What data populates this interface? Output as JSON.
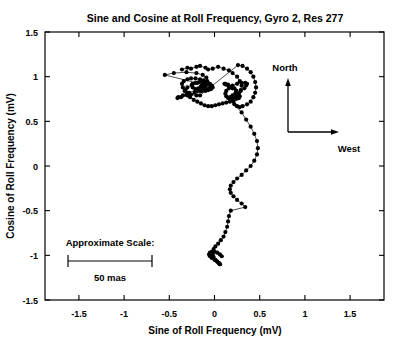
{
  "chart_data": {
    "type": "scatter",
    "title": "Sine and Cosine at Roll Frequency, Gyro 2, Res 277",
    "xlabel": "Sine of Roll Frequency (mV)",
    "ylabel": "Cosine of Roll Frequency (mV)",
    "xlim": [
      -1.875,
      1.875
    ],
    "ylim": [
      -1.5,
      1.5
    ],
    "xticks": [
      -1.5,
      -1,
      -0.5,
      0,
      0.5,
      1,
      1.5
    ],
    "xticklabels": [
      "-1.5",
      "-1",
      "-0.5",
      "0",
      "0.5",
      "1",
      "1.5"
    ],
    "yticks": [
      -1.5,
      -1,
      -0.5,
      0,
      0.5,
      1,
      1.5
    ],
    "yticklabels": [
      "-1.5",
      "-1",
      "-0.5",
      "0",
      "0.5",
      "1",
      "1.5"
    ],
    "grid": false,
    "legend": false,
    "marker": "filled-circle",
    "line": "connected-path",
    "series": [
      {
        "name": "roll phase trajectory",
        "x": [
          -0.36,
          -0.3,
          -0.26,
          -0.2,
          -0.16,
          -0.1,
          -0.07,
          -0.02,
          0.04,
          0.1,
          0.16,
          0.2,
          0.25,
          0.28,
          0.3,
          0.29,
          0.26,
          0.24,
          0.22,
          0.2,
          0.17,
          0.13,
          0.09,
          0.05,
          0.01,
          -0.03,
          -0.07,
          -0.11,
          -0.15,
          -0.19,
          -0.23,
          -0.27,
          -0.31,
          -0.33,
          -0.35,
          -0.36,
          -0.34,
          -0.3,
          -0.26,
          -0.21,
          -0.16,
          -0.12,
          -0.08,
          -0.05,
          -0.03,
          -0.02,
          -0.04,
          -0.07,
          -0.1,
          -0.14,
          -0.18,
          -0.21,
          -0.24,
          -0.25,
          -0.24,
          -0.21,
          -0.17,
          -0.13,
          -0.09,
          -0.06,
          -0.04,
          -0.05,
          -0.08,
          -0.12,
          -0.16,
          -0.19,
          -0.2,
          -0.18,
          -0.15,
          -0.12,
          -0.1,
          -0.09,
          -0.1,
          -0.12,
          -0.14,
          -0.15,
          -0.14,
          -0.12,
          -0.11,
          -0.1,
          -0.11,
          -0.13,
          -0.14,
          -0.13,
          -0.12,
          -0.12,
          -0.13,
          -0.14,
          -0.13,
          -0.12,
          -0.55,
          -0.45,
          -0.31,
          -0.2,
          -0.13,
          -0.09,
          -0.08,
          -0.1,
          -0.15,
          -0.22,
          -0.3,
          -0.37,
          -0.41,
          -0.4,
          -0.35,
          -0.28,
          -0.21,
          -0.15,
          -0.1,
          -0.08,
          -0.09,
          -0.13,
          -0.19,
          -0.25,
          -0.3,
          -0.32,
          -0.3,
          -0.26,
          -0.2,
          -0.16,
          0.26,
          0.31,
          0.36,
          0.4,
          0.43,
          0.45,
          0.46,
          0.45,
          0.43,
          0.4,
          0.36,
          0.31,
          0.28,
          0.25,
          0.22,
          0.21,
          0.22,
          0.25,
          0.29,
          0.33,
          0.35,
          0.36,
          0.34,
          0.3,
          0.25,
          0.2,
          0.16,
          0.13,
          0.12,
          0.13,
          0.16,
          0.2,
          0.24,
          0.27,
          0.28,
          0.27,
          0.24,
          0.2,
          0.16,
          0.13,
          0.11,
          0.12,
          0.15,
          0.19,
          0.22,
          0.24,
          0.23,
          0.2,
          0.17,
          0.15,
          0.3,
          0.35,
          0.4,
          0.44,
          0.47,
          0.48,
          0.47,
          0.44,
          0.4,
          0.35,
          0.3,
          0.25,
          0.21,
          0.18,
          0.17,
          0.18,
          0.21,
          0.25,
          0.3,
          0.34,
          0.18,
          0.16,
          0.15,
          0.14,
          0.12,
          0.1,
          0.07,
          0.04,
          0.01,
          -0.01,
          -0.02,
          -0.02,
          -0.01,
          0.01,
          0.03,
          0.05,
          0.06,
          0.06,
          0.05,
          0.03,
          0.0,
          -0.03,
          -0.05,
          -0.06,
          -0.05,
          -0.03,
          0.0,
          0.03,
          0.06,
          0.08
        ],
        "y": [
          1.08,
          1.1,
          1.09,
          1.11,
          1.12,
          1.1,
          1.08,
          1.09,
          1.11,
          1.09,
          1.07,
          1.04,
          1.0,
          0.95,
          0.9,
          0.85,
          0.81,
          0.78,
          0.76,
          0.74,
          0.72,
          0.71,
          0.7,
          0.69,
          0.68,
          0.67,
          0.67,
          0.68,
          0.7,
          0.72,
          0.74,
          0.77,
          0.8,
          0.84,
          0.88,
          0.92,
          0.95,
          0.97,
          0.98,
          0.98,
          0.97,
          0.96,
          0.94,
          0.92,
          0.9,
          0.88,
          0.86,
          0.85,
          0.84,
          0.84,
          0.85,
          0.86,
          0.88,
          0.9,
          0.92,
          0.93,
          0.94,
          0.94,
          0.93,
          0.92,
          0.9,
          0.88,
          0.86,
          0.85,
          0.84,
          0.84,
          0.85,
          0.87,
          0.89,
          0.9,
          0.91,
          0.91,
          0.9,
          0.89,
          0.88,
          0.87,
          0.87,
          0.88,
          0.89,
          0.9,
          0.91,
          0.91,
          0.9,
          0.89,
          0.88,
          0.88,
          0.89,
          0.9,
          0.91,
          0.91,
          1.02,
          1.04,
          1.05,
          1.04,
          1.02,
          0.99,
          0.95,
          0.9,
          0.86,
          0.82,
          0.79,
          0.77,
          0.76,
          0.77,
          0.79,
          0.82,
          0.85,
          0.88,
          0.91,
          0.93,
          0.94,
          0.94,
          0.93,
          0.91,
          0.88,
          0.85,
          0.82,
          0.8,
          0.79,
          0.79,
          1.13,
          1.12,
          1.09,
          1.05,
          1.0,
          0.94,
          0.88,
          0.82,
          0.77,
          0.72,
          0.69,
          0.67,
          0.66,
          0.67,
          0.69,
          0.72,
          0.76,
          0.8,
          0.84,
          0.87,
          0.9,
          0.92,
          0.93,
          0.93,
          0.92,
          0.9,
          0.87,
          0.84,
          0.81,
          0.78,
          0.76,
          0.75,
          0.75,
          0.76,
          0.78,
          0.81,
          0.84,
          0.87,
          0.89,
          0.91,
          0.92,
          0.92,
          0.91,
          0.89,
          0.87,
          0.84,
          0.81,
          0.79,
          0.77,
          0.76,
          0.6,
          0.52,
          0.44,
          0.36,
          0.28,
          0.2,
          0.13,
          0.06,
          0.0,
          -0.05,
          -0.1,
          -0.14,
          -0.18,
          -0.22,
          -0.26,
          -0.3,
          -0.34,
          -0.38,
          -0.42,
          -0.46,
          -0.5,
          -0.56,
          -0.62,
          -0.68,
          -0.74,
          -0.79,
          -0.83,
          -0.87,
          -0.9,
          -0.93,
          -0.96,
          -0.99,
          -1.02,
          -1.05,
          -1.07,
          -1.09,
          -1.1,
          -1.1,
          -1.09,
          -1.07,
          -1.05,
          -1.03,
          -1.01,
          -0.99,
          -0.97,
          -0.96,
          -0.96,
          -0.97,
          -0.99,
          -1.01
        ]
      }
    ],
    "annotations": {
      "compass": {
        "north_label": "North",
        "west_label": "West"
      },
      "scale": {
        "title": "Approximate Scale:",
        "value_label": "50 mas"
      }
    }
  }
}
